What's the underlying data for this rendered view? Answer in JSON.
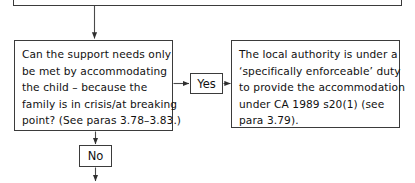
{
  "diagram": {
    "colors": {
      "box_border": "#3b3b3b",
      "text": "#111111",
      "connector": "#4a4a4a",
      "background": "#ffffff"
    }
  },
  "nodes": {
    "top_box": {
      "name": "preceding-step-box",
      "text": ""
    },
    "question_box": {
      "name": "support-needs-question-box",
      "lines": [
        "Can the support needs only",
        "be met by accommodating",
        "the child – because the",
        "family is in crisis/at breaking",
        "point? (See paras 3.78–3.83.)"
      ]
    },
    "outcome_box": {
      "name": "local-authority-duty-box",
      "lines": [
        "The local authority is under a",
        "‘specifically enforceable’ duty",
        "to provide the accommodation",
        "under CA 1989 s20(1)  (see",
        "para 3.79)."
      ]
    }
  },
  "labels": {
    "yes": "Yes",
    "no": "No"
  },
  "connectors": [
    {
      "name": "top-to-question-arrow",
      "from": "top_box",
      "to": "question_box",
      "direction": "down"
    },
    {
      "name": "question-to-yes-arrow",
      "from": "question_box",
      "to": "yes_label",
      "direction": "right"
    },
    {
      "name": "yes-to-outcome-arrow",
      "from": "yes_label",
      "to": "outcome_box",
      "direction": "right"
    },
    {
      "name": "question-to-no-arrow",
      "from": "question_box",
      "to": "no_label",
      "direction": "down"
    },
    {
      "name": "no-to-next-arrow",
      "from": "no_label",
      "to": "next_step",
      "direction": "down"
    }
  ]
}
